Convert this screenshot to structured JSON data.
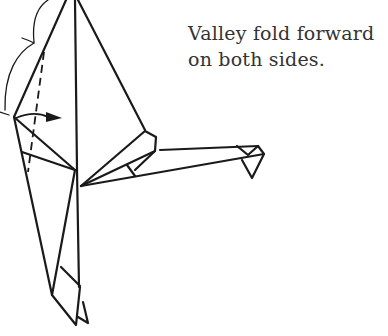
{
  "instruction": {
    "line1": "Valley fold forward",
    "line2": "on both sides."
  },
  "diagram": {
    "stroke_color": "#1a1a1a",
    "elements": [
      "outline",
      "valley-fold-dashed-line",
      "fold-arrow",
      "brace-marks"
    ]
  }
}
